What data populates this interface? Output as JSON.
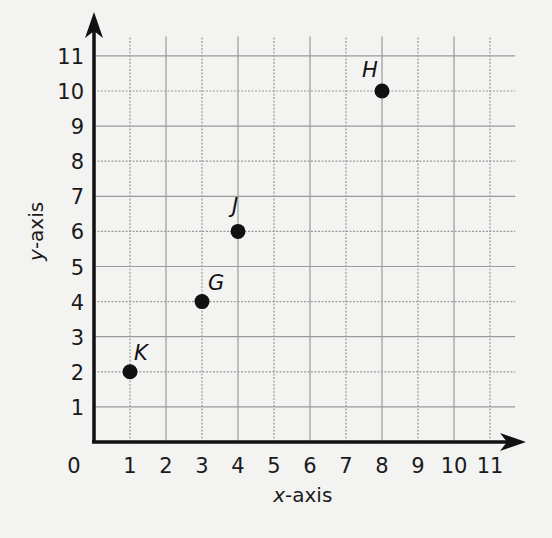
{
  "chart_data": {
    "type": "scatter",
    "title": "",
    "xlabel": "x-axis",
    "ylabel": "y-axis",
    "xlim": [
      0,
      11
    ],
    "ylim": [
      0,
      11
    ],
    "grid": true,
    "x_ticks": [
      "0",
      "1",
      "2",
      "3",
      "4",
      "5",
      "6",
      "7",
      "8",
      "9",
      "10",
      "11"
    ],
    "y_ticks": [
      "1",
      "2",
      "3",
      "4",
      "5",
      "6",
      "7",
      "8",
      "9",
      "10",
      "11"
    ],
    "points": [
      {
        "label": "K",
        "x": 1,
        "y": 2
      },
      {
        "label": "G",
        "x": 3,
        "y": 4
      },
      {
        "label": "J",
        "x": 4,
        "y": 6
      },
      {
        "label": "H",
        "x": 8,
        "y": 10
      }
    ]
  },
  "colors": {
    "axis": "#111111",
    "grid": "#9a9a9a",
    "point": "#111111",
    "background": "#f3f3f1"
  }
}
